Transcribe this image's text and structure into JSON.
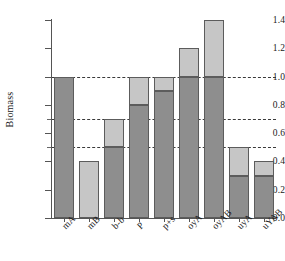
{
  "chart_data": {
    "type": "bar",
    "title": "",
    "subtitle": "",
    "xlabel": "",
    "ylabel": "Biomass",
    "ylim": [
      0.0,
      1.4
    ],
    "ytick_labels": [
      "0.0",
      "0.2",
      "0.4",
      "0.6",
      "0.8",
      "1.0",
      "1.2",
      "1.4"
    ],
    "ytick_values": [
      0.0,
      0.2,
      0.4,
      0.6,
      0.8,
      1.0,
      1.2,
      1.4
    ],
    "minor_ticks": [
      0.5,
      0.7
    ],
    "grid": true,
    "gridlines": [
      0.5,
      0.7,
      1.0
    ],
    "legend": [],
    "stacked": true,
    "categories": [
      "mA",
      "mB",
      "b-b",
      "P",
      "p+s",
      "oyA",
      "oyAB",
      "uyA",
      "uYAB"
    ],
    "series": [
      {
        "name": "lower-segment",
        "color": "#8e8e8e",
        "values": [
          1.0,
          0.0,
          0.5,
          0.8,
          0.9,
          1.0,
          1.0,
          0.3,
          0.3
        ]
      },
      {
        "name": "upper-segment",
        "color": "#c6c6c6",
        "values": [
          0.0,
          0.4,
          0.2,
          0.2,
          0.1,
          0.2,
          0.4,
          0.2,
          0.1
        ]
      }
    ],
    "totals": [
      1.0,
      0.4,
      0.7,
      1.0,
      1.0,
      1.2,
      1.4,
      0.5,
      0.4
    ]
  },
  "style": {
    "dark_gray": "#8e8e8e",
    "light_gray": "#c6c6c6",
    "edge": "#5c5c5c",
    "axis": "#555555",
    "text": "#1a1a1a",
    "background": "#ffffff"
  }
}
